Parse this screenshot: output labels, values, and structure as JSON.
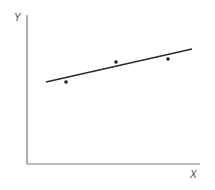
{
  "diagram": {
    "type": "scatter-with-fit-line",
    "y_axis_label": "Y",
    "x_axis_label": "X",
    "points": [
      {
        "x": 66,
        "y": 82
      },
      {
        "x": 116,
        "y": 62
      },
      {
        "x": 168,
        "y": 59
      }
    ],
    "fit_line": {
      "x1": 46,
      "y1": 82,
      "x2": 192,
      "y2": 49
    },
    "colors": {
      "axis": "#777777",
      "line": "#2a2a2a",
      "points": "#222222"
    }
  }
}
